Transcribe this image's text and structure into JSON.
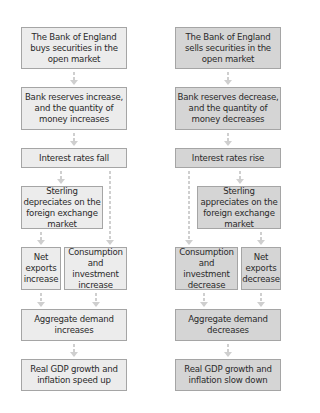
{
  "diagram": {
    "left": {
      "title": "Expansionary (buy securities)",
      "steps": [
        "The Bank of England buys securities in the open market",
        "Bank reserves increase, and the quantity of money increases",
        "Interest rates fall",
        "Sterling depreciates on the foreign exchange market",
        "Net exports increase",
        "Consumption and investment increase",
        "Aggregate demand increases",
        "Real GDP growth and inflation speed up"
      ]
    },
    "right": {
      "title": "Contractionary (sell securities)",
      "steps": [
        "The Bank of England sells securities in the open market",
        "Bank reserves decrease, and the quantity of money decreases",
        "Interest rates rise",
        "Sterling appreciates on the foreign exchange market",
        "Consumption and investment decrease",
        "Net exports decrease",
        "Aggregate demand decreases",
        "Real GDP growth and inflation slow down"
      ]
    },
    "colors": {
      "left_fill": "#ececec",
      "right_fill": "#d5d5d5",
      "border": "#a5a5a5",
      "arrow": "#cfcfcf",
      "text": "#2a2a2a"
    }
  }
}
